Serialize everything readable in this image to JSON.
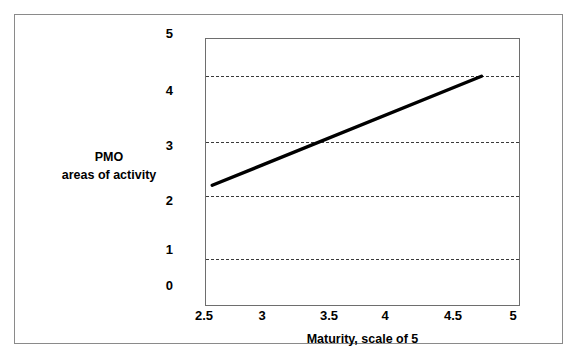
{
  "chart_data": {
    "type": "line",
    "title": "",
    "xlabel": "Maturity, scale of 5",
    "ylabel": "PMO areas of activity",
    "ylabel_line1": "PMO",
    "ylabel_line2": "areas of activity",
    "xlim": [
      2.5,
      5.0
    ],
    "ylim": [
      0,
      5
    ],
    "xticks": [
      "2.5",
      "3",
      "3.5",
      "4",
      "4.5",
      "5"
    ],
    "xtick_values": [
      2.5,
      3,
      3.5,
      4,
      4.5,
      5
    ],
    "yticks": [
      "5",
      "4",
      "3",
      "2",
      "1",
      "0"
    ],
    "ytick_values": [
      5,
      4,
      3,
      2,
      1,
      0
    ],
    "grid": true,
    "gridlines_y": [
      4.2,
      3.2,
      2.25,
      1.2
    ],
    "legend": "none",
    "series": [
      {
        "name": "PMO areas of activity vs maturity",
        "color": "#000000",
        "linewidth": 3,
        "x": [
          2.55,
          4.7
        ],
        "y": [
          2.25,
          4.3
        ]
      }
    ]
  },
  "figure": {
    "background_color": "#ffffff",
    "frame_color": "#8a8a8a",
    "plot_border_color": "#6e6e6e",
    "gridline_color": "#3a3a3a"
  }
}
